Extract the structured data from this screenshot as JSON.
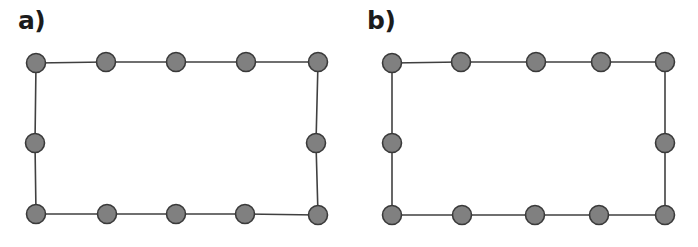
{
  "figure": {
    "background_color": "#ffffff",
    "node_fill_color": "#808080",
    "node_stroke_color": "#3a3a3a",
    "edge_color": "#404040",
    "label_color": "#1c1c1c",
    "node_radius": 9.5,
    "node_stroke_width": 1.6,
    "edge_stroke_width": 1.6
  },
  "panels": [
    {
      "id": "a",
      "label": "a)",
      "graph": {
        "type": "cycle",
        "node_count": 12,
        "edge_count": 12,
        "nodes_top": 5,
        "nodes_bottom": 5,
        "nodes_left_side_extra": 1,
        "nodes_right_side_extra": 1,
        "nodes": [
          {
            "index": 0,
            "name": "top-left-corner",
            "x": 36,
            "y": 63
          },
          {
            "index": 1,
            "name": "top-1",
            "x": 106,
            "y": 62
          },
          {
            "index": 2,
            "name": "top-2",
            "x": 176,
            "y": 62
          },
          {
            "index": 3,
            "name": "top-3",
            "x": 246,
            "y": 62
          },
          {
            "index": 4,
            "name": "top-right-corner",
            "x": 318,
            "y": 62
          },
          {
            "index": 5,
            "name": "right-middle",
            "x": 316,
            "y": 143
          },
          {
            "index": 6,
            "name": "bottom-right-corner",
            "x": 318,
            "y": 215
          },
          {
            "index": 7,
            "name": "bottom-3",
            "x": 245,
            "y": 214
          },
          {
            "index": 8,
            "name": "bottom-2",
            "x": 176,
            "y": 214
          },
          {
            "index": 9,
            "name": "bottom-1",
            "x": 107,
            "y": 214
          },
          {
            "index": 10,
            "name": "bottom-left-corner",
            "x": 36,
            "y": 214
          },
          {
            "index": 11,
            "name": "left-middle",
            "x": 35,
            "y": 143
          }
        ],
        "edges": [
          [
            0,
            1
          ],
          [
            1,
            2
          ],
          [
            2,
            3
          ],
          [
            3,
            4
          ],
          [
            4,
            5
          ],
          [
            5,
            6
          ],
          [
            6,
            7
          ],
          [
            7,
            8
          ],
          [
            8,
            9
          ],
          [
            9,
            10
          ],
          [
            10,
            11
          ],
          [
            11,
            0
          ]
        ]
      }
    },
    {
      "id": "b",
      "label": "b)",
      "graph": {
        "type": "cycle",
        "node_count": 12,
        "edge_count": 12,
        "nodes_top": 5,
        "nodes_bottom": 5,
        "nodes_left_side_extra": 1,
        "nodes_right_side_extra": 1,
        "nodes": [
          {
            "index": 0,
            "name": "top-left-corner",
            "x": 43,
            "y": 63
          },
          {
            "index": 1,
            "name": "top-1",
            "x": 112,
            "y": 62
          },
          {
            "index": 2,
            "name": "top-2",
            "x": 187,
            "y": 62
          },
          {
            "index": 3,
            "name": "top-3",
            "x": 252,
            "y": 62
          },
          {
            "index": 4,
            "name": "top-right-corner",
            "x": 316,
            "y": 62
          },
          {
            "index": 5,
            "name": "right-middle",
            "x": 316,
            "y": 143
          },
          {
            "index": 6,
            "name": "bottom-right-corner",
            "x": 316,
            "y": 215
          },
          {
            "index": 7,
            "name": "bottom-3",
            "x": 250,
            "y": 215
          },
          {
            "index": 8,
            "name": "bottom-2",
            "x": 186,
            "y": 215
          },
          {
            "index": 9,
            "name": "bottom-1",
            "x": 113,
            "y": 215
          },
          {
            "index": 10,
            "name": "bottom-left-corner",
            "x": 43,
            "y": 215
          },
          {
            "index": 11,
            "name": "left-middle",
            "x": 43,
            "y": 143
          }
        ],
        "edges": [
          [
            0,
            1
          ],
          [
            1,
            2
          ],
          [
            2,
            3
          ],
          [
            3,
            4
          ],
          [
            4,
            5
          ],
          [
            5,
            6
          ],
          [
            6,
            7
          ],
          [
            7,
            8
          ],
          [
            8,
            9
          ],
          [
            9,
            10
          ],
          [
            10,
            11
          ],
          [
            11,
            0
          ]
        ]
      }
    }
  ]
}
